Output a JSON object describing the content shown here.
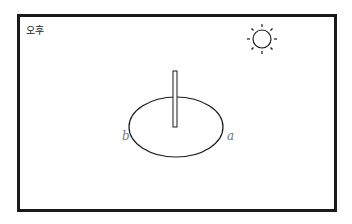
{
  "diagram": {
    "time_of_day": "오후",
    "sun_icon": "sun-icon",
    "points": {
      "a": "a",
      "b": "b"
    },
    "colors": {
      "stroke": "#1a1a1a",
      "label": "#777777",
      "background": "#ffffff"
    }
  }
}
